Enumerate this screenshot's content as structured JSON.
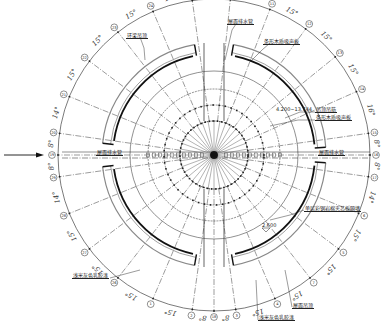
{
  "drawing": {
    "type": "radial architectural plan",
    "center": [
      214,
      155
    ],
    "radii": {
      "dimension_circle": 156,
      "outer_wall_outer": 112,
      "outer_wall_inner": 104,
      "outer_wall_bold": 101,
      "ring_1": 84,
      "ring_2": 66,
      "ring_3": 50,
      "ring_4": 34,
      "hub": 4
    },
    "colors": {
      "line": "#222222",
      "bold": "#111111",
      "wall_fill": "#f2f2f2",
      "background": "#ffffff"
    }
  },
  "angles": {
    "left_top": [
      "8°",
      "14°",
      "15°",
      "15°",
      "15°",
      "15°"
    ],
    "top": [
      "14°"
    ],
    "right_top": [
      "15°",
      "15°",
      "15°",
      "15°",
      "8°"
    ],
    "right_bottom": [
      "8°",
      "14°",
      "15°",
      "15°",
      "15°"
    ],
    "bottom": [
      "15°",
      "8°",
      "8°",
      "14°"
    ],
    "left_bottom": [
      "8°",
      "15°",
      "15°",
      "15°",
      "15°",
      "14°"
    ]
  },
  "axis_bubbles": [
    {
      "id": "19",
      "deg": 180
    },
    {
      "id": "20",
      "deg": 172
    },
    {
      "id": "21",
      "deg": 158
    },
    {
      "id": "22",
      "deg": 143
    },
    {
      "id": "23",
      "deg": 128
    },
    {
      "id": "24",
      "deg": 113
    },
    {
      "id": "25",
      "deg": 98
    },
    {
      "id": "10",
      "deg": 84
    },
    {
      "id": "11",
      "deg": 69
    },
    {
      "id": "12",
      "deg": 54
    },
    {
      "id": "13",
      "deg": 39
    },
    {
      "id": "14",
      "deg": 24
    },
    {
      "id": "15",
      "deg": 8
    },
    {
      "id": "16",
      "deg": 0
    },
    {
      "id": "17",
      "deg": -8
    },
    {
      "id": "6",
      "deg": -22
    },
    {
      "id": "5",
      "deg": -37
    },
    {
      "id": "7",
      "deg": -52
    },
    {
      "id": "4",
      "deg": -67
    },
    {
      "id": "3",
      "deg": -82
    },
    {
      "id": "18",
      "deg": -90
    },
    {
      "id": "2",
      "deg": -98
    },
    {
      "id": "1",
      "deg": -113
    },
    {
      "id": "26",
      "deg": -128
    },
    {
      "id": "27",
      "deg": -143
    },
    {
      "id": "28",
      "deg": -158
    },
    {
      "id": "29",
      "deg": -172
    }
  ],
  "labels": {
    "top_left_callout": "环梁吊顶",
    "top_center_callout": "屋面排水管",
    "top_right_callout": "条形木质吸声板",
    "right_callout_1": "吊顶吊筋",
    "right_callout_2": "条形木质吸声板",
    "right_elevation": "4.200~13.744",
    "left_center_callout": "屋面排水管",
    "right_center_callout": "屋面排水管",
    "lower_right_callout": "单层彩钢岩棉夹芯板隔墙",
    "lower_right_elevation": "2.600",
    "bottom_right_callout": "屋面吊顶",
    "bottom_center_callout": "浅米灰色乳胶漆",
    "left_lower_callout": "浅米灰色乳胶漆"
  },
  "entrance_arrow": {
    "direction": "right",
    "label": ""
  }
}
